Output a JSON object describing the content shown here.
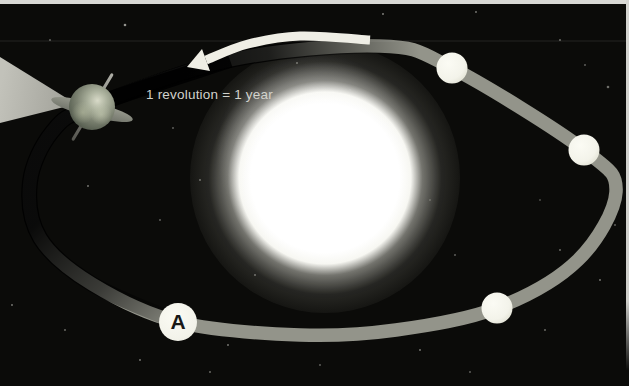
{
  "caption": {
    "label": "1 revolution = 1 year",
    "x": 146,
    "y": 87
  },
  "marker": {
    "label": "A",
    "x": 178,
    "y": 322,
    "r": 19
  },
  "colors": {
    "background": "#0b0b09",
    "orbit_band": "#93948a",
    "orbit_shadow": "#000000",
    "arrow": "#efeee5",
    "moon_fill": "#f3f3ea",
    "sun_core": "#ffffff",
    "beam_light": "#c2c2ba",
    "beam_dark": "#9f9f97",
    "caption_text": "#d2d2cc",
    "frame": "#d9d9d5",
    "star": "#cfcfc8"
  },
  "orbit": {
    "stroke_width": 13.5,
    "points": [
      [
        92,
        106
      ],
      [
        230,
        60
      ],
      [
        380,
        46
      ],
      [
        452,
        68
      ],
      [
        584,
        150
      ],
      [
        616,
        192
      ],
      [
        578,
        260
      ],
      [
        497,
        308
      ],
      [
        396,
        330
      ],
      [
        300,
        335
      ],
      [
        178,
        322
      ],
      [
        92,
        284
      ],
      [
        40,
        238
      ],
      [
        30,
        182
      ],
      [
        52,
        132
      ]
    ],
    "shadow_left_points": [
      [
        178,
        322
      ],
      [
        92,
        284
      ],
      [
        40,
        238
      ],
      [
        30,
        182
      ],
      [
        52,
        132
      ],
      [
        92,
        106
      ],
      [
        230,
        60
      ]
    ],
    "shadow_top_points": [
      [
        92,
        106
      ],
      [
        230,
        60
      ],
      [
        380,
        46
      ],
      [
        452,
        68
      ]
    ]
  },
  "moons": [
    {
      "x": 452,
      "y": 68,
      "r": 15.5
    },
    {
      "x": 584,
      "y": 150,
      "r": 15.5
    },
    {
      "x": 497,
      "y": 308,
      "r": 15.5
    }
  ],
  "sun": {
    "x": 325,
    "y": 178,
    "halo_d": 270
  },
  "earth": {
    "x": 92,
    "y": 107,
    "size": 52
  },
  "beam": {
    "points": [
      [
        0,
        57
      ],
      [
        0,
        123
      ],
      [
        76,
        104
      ]
    ]
  },
  "arrow": {
    "width": 9,
    "path_points": [
      [
        370,
        40
      ],
      [
        300,
        36
      ],
      [
        248,
        44
      ],
      [
        206,
        60
      ]
    ],
    "head_points": [
      [
        187,
        67
      ],
      [
        202,
        49
      ],
      [
        210,
        71
      ]
    ]
  },
  "stars": [
    [
      125,
      25,
      2,
      0.7
    ],
    [
      297,
      63,
      1.5,
      0.45
    ],
    [
      383,
      14,
      1.5,
      0.55
    ],
    [
      476,
      12,
      1.5,
      0.5
    ],
    [
      560,
      40,
      1.5,
      0.45
    ],
    [
      608,
      87,
      2,
      0.5
    ],
    [
      50,
      40,
      1.5,
      0.4
    ],
    [
      22,
      96,
      1.5,
      0.45
    ],
    [
      88,
      186,
      1.5,
      0.5
    ],
    [
      35,
      240,
      1.5,
      0.5
    ],
    [
      12,
      305,
      1.5,
      0.5
    ],
    [
      105,
      290,
      1.5,
      0.45
    ],
    [
      140,
      360,
      1.5,
      0.5
    ],
    [
      228,
      345,
      1.5,
      0.5
    ],
    [
      210,
      372,
      1.5,
      0.45
    ],
    [
      320,
      365,
      1.5,
      0.4
    ],
    [
      420,
      350,
      1.5,
      0.5
    ],
    [
      470,
      372,
      1.5,
      0.4
    ],
    [
      545,
      330,
      1.5,
      0.45
    ],
    [
      600,
      280,
      1.5,
      0.5
    ],
    [
      615,
      225,
      1.5,
      0.4
    ],
    [
      560,
      250,
      1.5,
      0.45
    ],
    [
      455,
      255,
      1.5,
      0.4
    ],
    [
      200,
      180,
      1.5,
      0.45
    ],
    [
      160,
      220,
      1.5,
      0.4
    ],
    [
      255,
      275,
      1.5,
      0.45
    ],
    [
      585,
      65,
      1.5,
      0.4
    ],
    [
      520,
      105,
      1.5,
      0.4
    ],
    [
      350,
      90,
      1.3,
      0.35
    ],
    [
      173,
      128,
      1.5,
      0.4
    ],
    [
      65,
      330,
      1.5,
      0.45
    ],
    [
      370,
      330,
      1.3,
      0.35
    ],
    [
      430,
      200,
      1.3,
      0.3
    ],
    [
      540,
      200,
      1.3,
      0.35
    ]
  ]
}
